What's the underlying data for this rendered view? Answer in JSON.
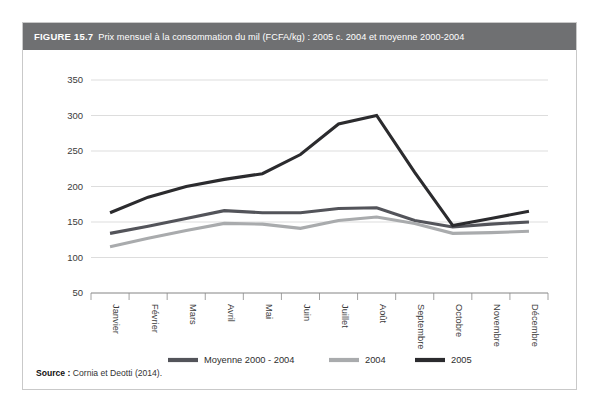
{
  "figure": {
    "number": "FIGURE 15.7",
    "title": "Prix mensuel à la consommation du mil (FCFA/kg) : 2005 c. 2004 et moyenne 2000-2004",
    "source_label": "Source :",
    "source_text": "Cornia et Deotti (2014)."
  },
  "colors": {
    "header_bar": "#6f7072",
    "header_text": "#ffffff",
    "card_border": "#c9c9c9",
    "gridline": "#d4d4d4",
    "axis": "#8a8a8a",
    "series_moyenne": "#53545a",
    "series_2004": "#a9abad",
    "series_2005": "#2b2b2e",
    "page_background": "#ffffff"
  },
  "chart_data": {
    "type": "line",
    "title": "Prix mensuel à la consommation du mil (FCFA/kg) : 2005 c. 2004 et moyenne 2000-2004",
    "xlabel": "",
    "ylabel": "",
    "categories": [
      "Janvier",
      "Février",
      "Mars",
      "Avril",
      "Mai",
      "Juin",
      "Juillet",
      "Août",
      "Septembre",
      "Octobre",
      "Novembre",
      "Décembre"
    ],
    "ylim": [
      50,
      350
    ],
    "yticks": [
      50,
      100,
      150,
      200,
      250,
      300,
      350
    ],
    "grid": true,
    "legend_position": "bottom",
    "series": [
      {
        "name": "Moyenne 2000 - 2004",
        "color": "#53545a",
        "values": [
          134,
          144,
          155,
          166,
          163,
          163,
          169,
          170,
          152,
          143,
          147,
          150
        ]
      },
      {
        "name": "2004",
        "color": "#a9abad",
        "values": [
          115,
          127,
          138,
          148,
          147,
          141,
          152,
          157,
          148,
          134,
          135,
          137
        ]
      },
      {
        "name": "2005",
        "color": "#2b2b2e",
        "values": [
          163,
          185,
          200,
          210,
          218,
          245,
          288,
          300,
          220,
          145,
          155,
          165
        ]
      }
    ]
  },
  "legend": {
    "items": [
      {
        "label": "Moyenne 2000 - 2004"
      },
      {
        "label": "2004"
      },
      {
        "label": "2005"
      }
    ]
  }
}
